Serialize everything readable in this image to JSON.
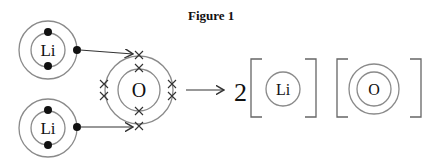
{
  "figure": {
    "title": "Figure 1"
  },
  "reactants": {
    "lithium_atoms": [
      {
        "symbol": "Li",
        "inner_electrons": 2,
        "outer_electrons": 1
      },
      {
        "symbol": "Li",
        "inner_electrons": 2,
        "outer_electrons": 1
      }
    ],
    "oxygen_atom": {
      "symbol": "O",
      "inner_electrons": 2,
      "outer_electrons": 6
    }
  },
  "products": {
    "coefficient": "2",
    "lithium_ion": {
      "symbol": "Li"
    },
    "oxide_ion": {
      "symbol": "O"
    }
  },
  "colors": {
    "shell": "#8a8a8a",
    "electron_dot": "#111111",
    "cross": "#333333",
    "arrow": "#333333",
    "bracket": "#666666"
  }
}
